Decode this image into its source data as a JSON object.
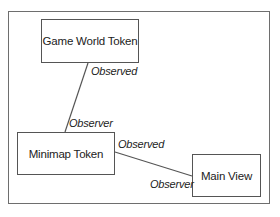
{
  "diagram": {
    "nodes": [
      {
        "id": "game-world-token",
        "label": "Game World Token"
      },
      {
        "id": "minimap-token",
        "label": "Minimap Token"
      },
      {
        "id": "main-view",
        "label": "Main View"
      }
    ],
    "edges": [
      {
        "from": "game-world-token",
        "to": "minimap-token",
        "from_role": "Observed",
        "to_role": "Observer"
      },
      {
        "from": "minimap-token",
        "to": "main-view",
        "from_role": "Observed",
        "to_role": "Observer"
      }
    ]
  }
}
